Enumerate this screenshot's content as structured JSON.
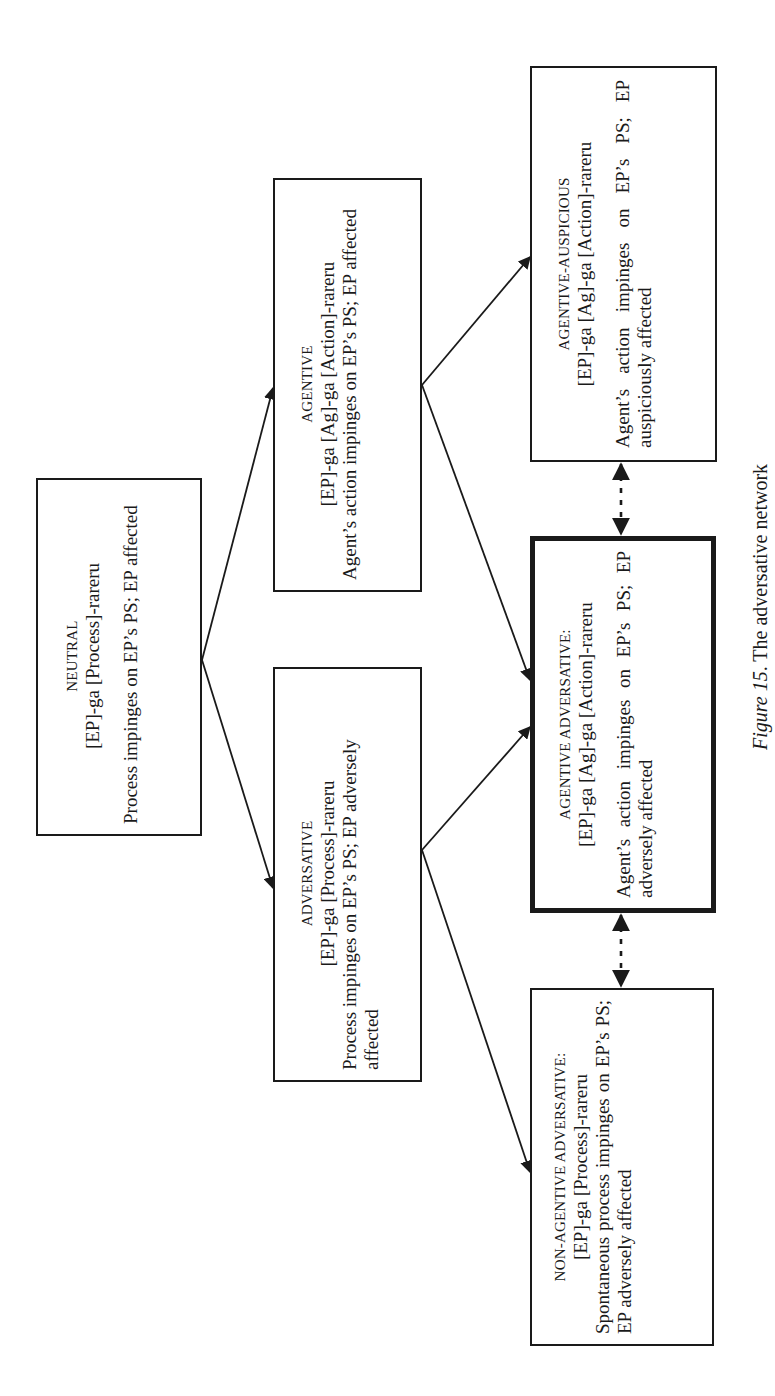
{
  "diagram": {
    "caption": {
      "figure_label": "Figure 15",
      "text": ". The adversative network"
    },
    "nodes": {
      "neutral": {
        "title": "NEUTRAL",
        "formula": "[EP]-ga [Process]-rareru",
        "description": "Process impinges on EP’s PS; EP affected"
      },
      "agentive": {
        "title": "AGENTIVE",
        "formula": "[EP]-ga [Ag]-ga [Action]-rareru",
        "description": "Agent’s action impinges on EP’s PS; EP affected"
      },
      "adversative": {
        "title": "ADVERSATIVE",
        "formula": "[EP]-ga [Process]-rareru",
        "description": "Process impinges on EP’s PS; EP adversely affected"
      },
      "agentive_auspicious": {
        "title": "AGENTIVE-AUSPICIOUS",
        "formula": "[EP]-ga [Ag]-ga [Action]-rareru",
        "description": "Agent’s action impinges on EP’s PS; EP auspiciously affected"
      },
      "agentive_adversative": {
        "title": "AGENTIVE ADVERSATIVE:",
        "formula": "[EP]-ga [Ag]-ga [Action]-rareru",
        "description": "Agent’s action impinges on EP’s PS; EP adversely affected",
        "emphasized": true
      },
      "non_agentive_adversative": {
        "title": "NON-AGENTIVE ADVERSATIVE:",
        "formula": "[EP]-ga [Process]-rareru",
        "description": "Spontaneous process impinges on EP’s PS; EP adversely affected"
      }
    },
    "edges": [
      {
        "from": "neutral",
        "to": "agentive",
        "style": "solid-arrow"
      },
      {
        "from": "neutral",
        "to": "adversative",
        "style": "solid-arrow"
      },
      {
        "from": "agentive",
        "to": "agentive_auspicious",
        "style": "solid-arrow"
      },
      {
        "from": "agentive",
        "to": "agentive_adversative",
        "style": "solid-arrow"
      },
      {
        "from": "adversative",
        "to": "agentive_adversative",
        "style": "solid-arrow"
      },
      {
        "from": "adversative",
        "to": "non_agentive_adversative",
        "style": "solid-arrow"
      },
      {
        "from": "agentive_auspicious",
        "to": "agentive_adversative",
        "style": "dotted-double-arrow"
      },
      {
        "from": "agentive_adversative",
        "to": "non_agentive_adversative",
        "style": "dotted-double-arrow"
      }
    ],
    "colors": {
      "stroke": "#1a1a1a",
      "background": "#ffffff"
    }
  }
}
